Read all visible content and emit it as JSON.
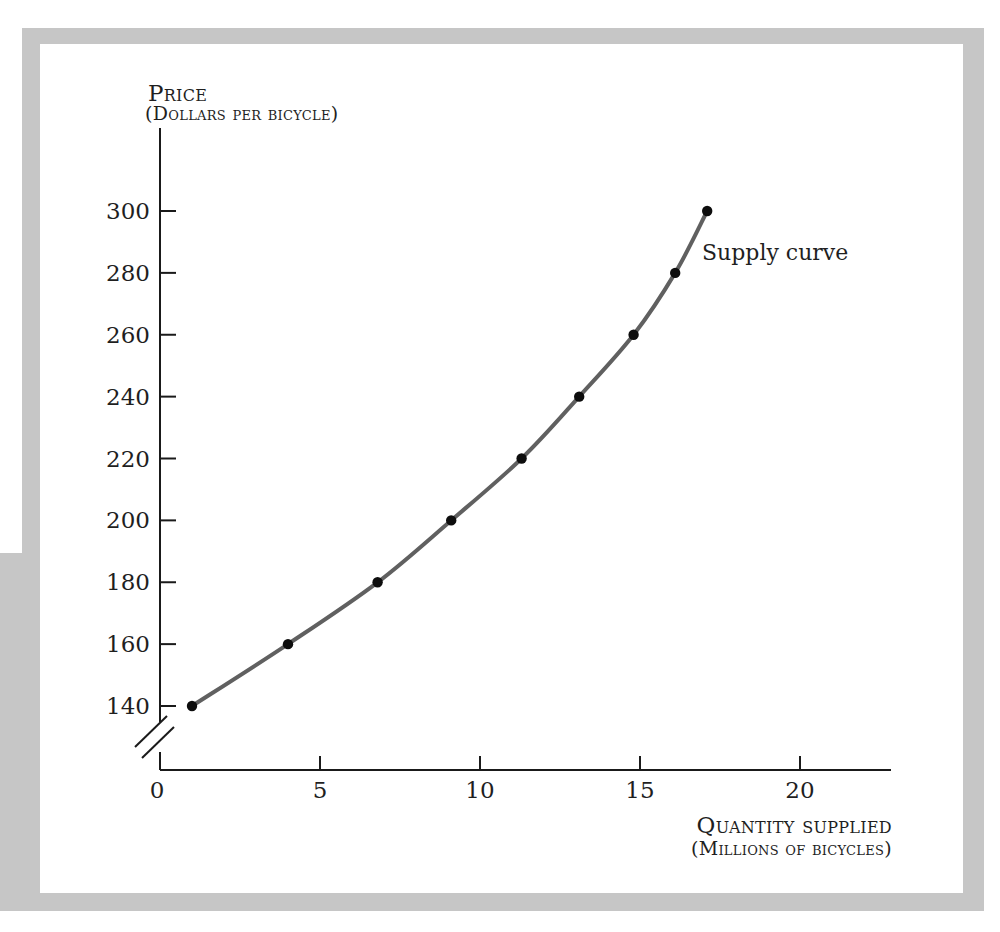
{
  "figure": {
    "y_axis_title": "Price",
    "y_axis_subtitle": "(Dollars per bicycle)",
    "x_axis_title": "Quantity supplied",
    "x_axis_subtitle": "(Millions of bicycles)",
    "curve_label": "Supply curve"
  },
  "chart_data": {
    "type": "line",
    "title": "",
    "xlabel": "Quantity supplied (millions of bicycles)",
    "ylabel": "Price (dollars per bicycle)",
    "x_ticks": [
      0,
      5,
      10,
      15,
      20
    ],
    "y_ticks": [
      140,
      160,
      180,
      200,
      220,
      240,
      260,
      280,
      300
    ],
    "xlim": [
      0,
      22.8
    ],
    "ylim": [
      140,
      300
    ],
    "axis_break_on_y": true,
    "grid": false,
    "legend_position": "none",
    "series": [
      {
        "name": "Supply curve",
        "points": [
          [
            1,
            140
          ],
          [
            4,
            160
          ],
          [
            6.8,
            180
          ],
          [
            9.1,
            200
          ],
          [
            11.3,
            220
          ],
          [
            13.1,
            240
          ],
          [
            14.8,
            260
          ],
          [
            16.1,
            280
          ],
          [
            17.1,
            300
          ]
        ]
      }
    ],
    "colors": {
      "curve": "#606060",
      "points": "#0d0d0d",
      "axis": "#1a1a1a",
      "frame": "#c6c6c6",
      "text": "#1f1f1f"
    }
  }
}
